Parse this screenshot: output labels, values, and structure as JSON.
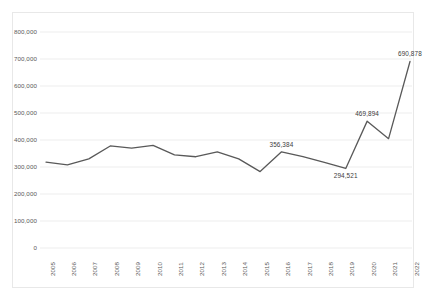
{
  "chart_data": {
    "type": "line",
    "title": "",
    "subtitle": "",
    "xlabel": "",
    "ylabel": "",
    "grid": true,
    "legend": false,
    "legend_position": "none",
    "line_color": "#595959",
    "gridline_color": "#e8e8e8",
    "border_color": "#e8e8e8",
    "ylim": [
      0,
      800000
    ],
    "ytick_labels": [
      "800,000",
      "700,000",
      "600,000",
      "500,000",
      "400,000",
      "300,000",
      "200,000",
      "100,000",
      "0"
    ],
    "ytick_values": [
      800000,
      700000,
      600000,
      500000,
      400000,
      300000,
      200000,
      100000,
      0
    ],
    "categories": [
      "2005",
      "2006",
      "2007",
      "2008",
      "2009",
      "2010",
      "2011",
      "2012",
      "2013",
      "2014",
      "2015",
      "2016",
      "2017",
      "2018",
      "2019",
      "2020",
      "2021",
      "2022"
    ],
    "values": [
      318000,
      308000,
      330000,
      378000,
      370000,
      380000,
      345000,
      338000,
      356000,
      330000,
      283000,
      356384,
      338000,
      317000,
      294521,
      469894,
      405000,
      690878
    ],
    "point_labels": [
      {
        "category": "2016",
        "value": 356384,
        "text": "356,384"
      },
      {
        "category": "2019",
        "value": 294521,
        "text": "294,521"
      },
      {
        "category": "2020",
        "value": 469894,
        "text": "469,894"
      },
      {
        "category": "2022",
        "value": 690878,
        "text": "690,878"
      }
    ]
  }
}
